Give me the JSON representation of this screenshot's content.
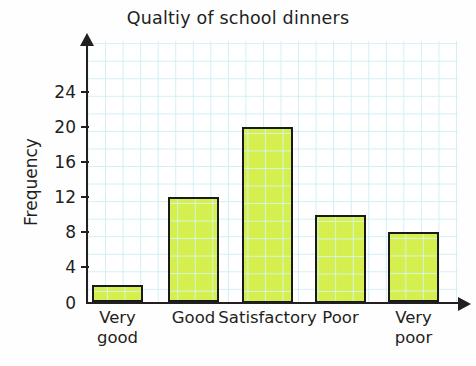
{
  "chart_data": {
    "type": "bar",
    "title": "Qualtiy of school dinners",
    "xlabel": "",
    "ylabel": "Frequency",
    "categories": [
      "Very\ngood",
      "Good",
      "Satisfactory",
      "Poor",
      "Very\npoor"
    ],
    "values": [
      2,
      12,
      20,
      10,
      8
    ],
    "ylim": [
      0,
      26
    ],
    "yticks": [
      0,
      4,
      8,
      12,
      16,
      20,
      24
    ],
    "ytick_labels": [
      "0",
      "4",
      "8",
      "12",
      "16",
      "20",
      "24"
    ],
    "grid": true,
    "legend": null,
    "colors": {
      "bar_fill": "#d4ef4e",
      "bar_border": "#1a1a1a",
      "grid_line": "#d2eff4",
      "axis": "#231f20",
      "text": "#231f20",
      "background": "#ffffff"
    }
  },
  "axis": {
    "y_arrow": "up-arrow-icon",
    "x_arrow": "right-arrow-icon"
  }
}
